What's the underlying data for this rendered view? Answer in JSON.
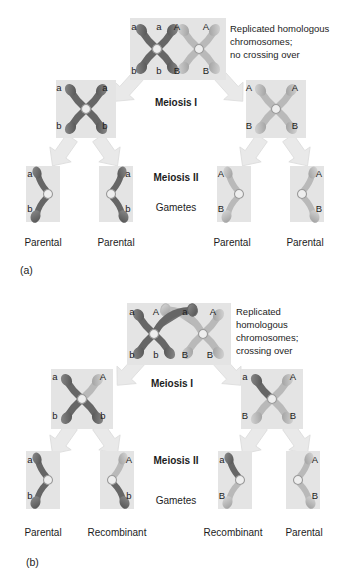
{
  "figure": {
    "colors": {
      "chromatid_dark": "#666666",
      "chromatid_light": "#b9b9b9",
      "cell_bg": "#e4e4e4",
      "arrow": "#e9e9e9",
      "centromere": "#eeeeee",
      "text": "#1c1c1c"
    },
    "panels": [
      {
        "tag": "(a)",
        "caption_lines": [
          "Replicated homologous",
          "chromosomes;",
          "no crossing over"
        ],
        "stage1_label": "Meiosis I",
        "stage2_label": "Meiosis II",
        "gametes_label": "Gametes",
        "parent_cell": {
          "top": [
            "a",
            "a",
            "A",
            "A"
          ],
          "bottom": [
            "b",
            "b",
            "B",
            "B"
          ]
        },
        "meiosis1_cells": [
          {
            "top": [
              "a",
              "a"
            ],
            "bottom": [
              "b",
              "b"
            ]
          },
          {
            "top": [
              "A",
              "A"
            ],
            "bottom": [
              "B",
              "B"
            ]
          }
        ],
        "gametes": [
          {
            "top": "a",
            "bottom": "b",
            "outcome": "Parental"
          },
          {
            "top": "a",
            "bottom": "b",
            "outcome": "Parental"
          },
          {
            "top": "A",
            "bottom": "B",
            "outcome": "Parental"
          },
          {
            "top": "A",
            "bottom": "B",
            "outcome": "Parental"
          }
        ]
      },
      {
        "tag": "(b)",
        "caption_lines": [
          "Replicated",
          "homologous",
          "chromosomes;",
          "crossing over"
        ],
        "stage1_label": "Meiosis I",
        "stage2_label": "Meiosis II",
        "gametes_label": "Gametes",
        "parent_cell": {
          "top": [
            "a",
            "A",
            "a",
            "A"
          ],
          "bottom": [
            "b",
            "b",
            "B",
            "B"
          ]
        },
        "meiosis1_cells": [
          {
            "top": [
              "a",
              "A"
            ],
            "bottom": [
              "b",
              "b"
            ]
          },
          {
            "top": [
              "a",
              "A"
            ],
            "bottom": [
              "B",
              "B"
            ]
          }
        ],
        "gametes": [
          {
            "top": "a",
            "bottom": "b",
            "outcome": "Parental"
          },
          {
            "top": "A",
            "bottom": "b",
            "outcome": "Recombinant"
          },
          {
            "top": "a",
            "bottom": "B",
            "outcome": "Recombinant"
          },
          {
            "top": "A",
            "bottom": "B",
            "outcome": "Parental"
          }
        ]
      }
    ]
  }
}
